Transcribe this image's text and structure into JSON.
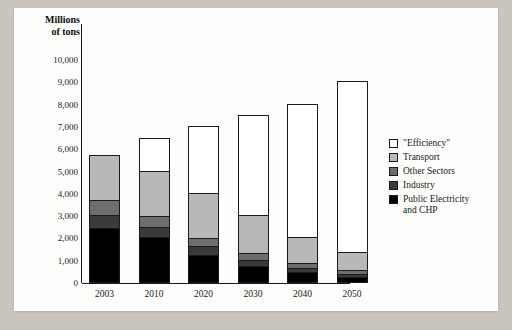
{
  "chart_data": {
    "type": "bar",
    "title": "",
    "xlabel": "",
    "ylabel": "Millions of tons",
    "ylabel_line1": "Millions",
    "ylabel_line2": "of tons",
    "ylim": [
      0,
      10000
    ],
    "ytick_values": [
      0,
      1000,
      2000,
      3000,
      4000,
      5000,
      6000,
      7000,
      8000,
      9000,
      10000
    ],
    "ytick_labels": [
      "0",
      "1,000",
      "2,000",
      "3,000",
      "4,000",
      "5,000",
      "6,000",
      "7,000",
      "8,000",
      "9,000",
      "10,000"
    ],
    "grid": false,
    "stacked": true,
    "legend_position": "right",
    "categories": [
      "2003",
      "2010",
      "2020",
      "2030",
      "2040",
      "2050"
    ],
    "series": [
      {
        "name": "Public Electricity and CHP",
        "color": "#000000",
        "values": [
          2420,
          2040,
          1230,
          700,
          450,
          220
        ]
      },
      {
        "name": "Industry",
        "color": "#3a3a3a",
        "values": [
          580,
          420,
          370,
          300,
          190,
          120
        ]
      },
      {
        "name": "Other Sectors",
        "color": "#6e6e6e",
        "values": [
          660,
          520,
          390,
          310,
          230,
          180
        ]
      },
      {
        "name": "Transport",
        "color": "#b8b8b8",
        "values": [
          2040,
          2020,
          2010,
          1690,
          1130,
          810
        ]
      },
      {
        "name": "\"Efficiency\"",
        "color": "#ffffff",
        "values": [
          0,
          1450,
          3000,
          4500,
          6000,
          7670
        ]
      }
    ],
    "totals": [
      5700,
      6450,
      7000,
      7500,
      8000,
      9000
    ],
    "legend_entries": [
      {
        "label": "\"Efficiency\"",
        "color": "#ffffff"
      },
      {
        "label": "Transport",
        "color": "#b8b8b8"
      },
      {
        "label": "Other Sectors",
        "color": "#6e6e6e"
      },
      {
        "label": "Industry",
        "color": "#3a3a3a"
      },
      {
        "label": "Public Electricity and CHP",
        "color": "#000000"
      }
    ],
    "legend_entry_lines": [
      [
        "\"Efficiency\""
      ],
      [
        "Transport"
      ],
      [
        "Other Sectors"
      ],
      [
        "Industry"
      ],
      [
        "Public Electricity",
        "and CHP"
      ]
    ]
  },
  "colors": {
    "page_background": "#c9c5bd",
    "panel_background": "#fdfdfb",
    "axis": "#1a1a1a",
    "text": "#1a1a1a"
  }
}
